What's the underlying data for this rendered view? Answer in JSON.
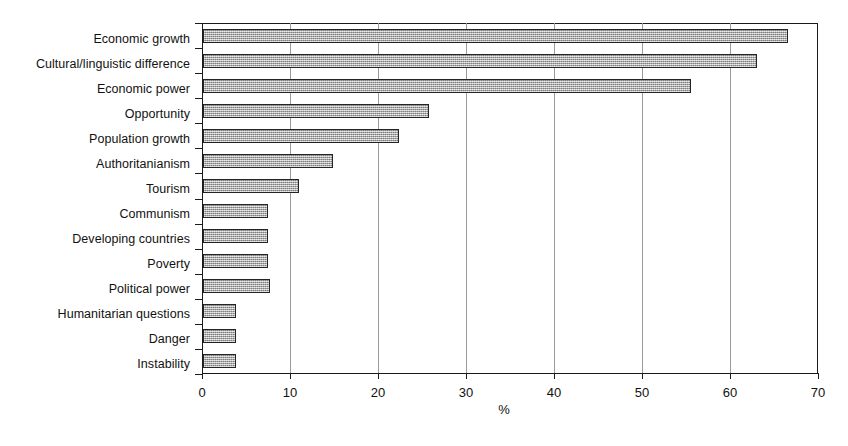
{
  "chart_data": {
    "type": "bar",
    "orientation": "horizontal",
    "title": "",
    "subtitle": "",
    "xlabel": "%",
    "ylabel": "",
    "xlim": [
      0,
      70
    ],
    "xticks": [
      0,
      10,
      20,
      30,
      40,
      50,
      60,
      70
    ],
    "xtick_labels": [
      "0",
      "10",
      "20",
      "30",
      "40",
      "50",
      "60",
      "70"
    ],
    "grid": "vertical",
    "legend": "none",
    "bar_fill_color": "#b0b0b0",
    "bar_edge_color": "#242424",
    "categories": [
      "Economic growth",
      "Cultural/linguistic difference",
      "Economic power",
      "Opportunity",
      "Population growth",
      "Authoritanianism",
      "Tourism",
      "Communism",
      "Developing countries",
      "Poverty",
      "Political power",
      "Humanitarian questions",
      "Danger",
      "Instability"
    ],
    "values": [
      66.5,
      62.9,
      55.4,
      25.7,
      22.3,
      14.8,
      10.9,
      7.4,
      7.4,
      7.4,
      7.6,
      3.8,
      3.7,
      3.8
    ]
  }
}
